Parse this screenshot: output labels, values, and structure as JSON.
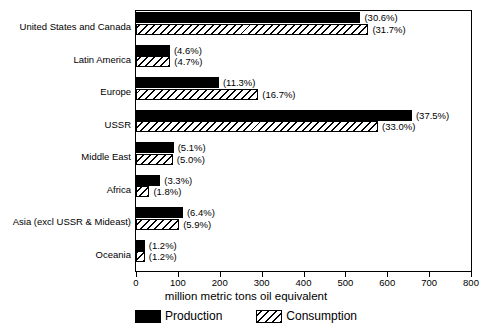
{
  "chart_data": {
    "type": "bar",
    "orientation": "horizontal",
    "title": "",
    "xlabel": "million metric tons oil equivalent",
    "ylabel": "",
    "xlim": [
      0,
      800
    ],
    "xticks": [
      0,
      100,
      200,
      300,
      400,
      500,
      600,
      700,
      800
    ],
    "grid": false,
    "legend_position": "bottom",
    "categories": [
      "United States and Canada",
      "Latin America",
      "Europe",
      "USSR",
      "Middle East",
      "Africa",
      "Asia (excl USSR & Mideast)",
      "Oceania"
    ],
    "series": [
      {
        "name": "Production",
        "values": [
          536,
          81,
          198,
          659,
          90,
          58,
          112,
          21
        ],
        "labels": [
          "(30.6%)",
          "(4.6%)",
          "(11.3%)",
          "(37.5%)",
          "(5.1%)",
          "(3.3%)",
          "(6.4%)",
          "(1.2%)"
        ]
      },
      {
        "name": "Consumption",
        "values": [
          555,
          82,
          292,
          578,
          88,
          32,
          103,
          21
        ],
        "labels": [
          "(31.7%)",
          "(4.7%)",
          "(16.7%)",
          "(33.0%)",
          "(5.0%)",
          "(1.8%)",
          "(5.9%)",
          "(1.2%)"
        ]
      }
    ]
  },
  "legend": {
    "production_label": "Production",
    "consumption_label": "Consumption"
  },
  "axis": {
    "title": "million metric tons oil equivalent",
    "tick_labels": [
      "0",
      "100",
      "200",
      "300",
      "400",
      "500",
      "600",
      "700",
      "800"
    ]
  }
}
